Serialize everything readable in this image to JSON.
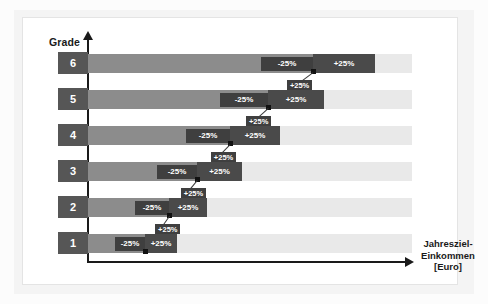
{
  "chart_data": {
    "type": "bar",
    "title": "",
    "xlabel": "Jahresziel-Einkommen [Euro]",
    "ylabel": "Grade",
    "categories": [
      "6",
      "5",
      "4",
      "3",
      "2",
      "1"
    ],
    "series": [
      {
        "name": "Grundgehalt",
        "values": [
          100,
          84,
          69,
          57,
          47,
          39
        ]
      }
    ],
    "band_labels": {
      "lower": "-25%",
      "upper": "+25%"
    },
    "connector_label": "+25%",
    "grid": false,
    "legend": "none",
    "note": "Gehaltsbandbreiten je Grade: Mitte +/- 25%, jede Grade-Obergrenze verbindet zur naechst hoeheren Grade"
  },
  "axes": {
    "y_title": "Grade",
    "x_title_line1": "Jahresziel-",
    "x_title_line2": "Einkommen",
    "x_title_line3": "[Euro]"
  },
  "rows": [
    {
      "grade": "6",
      "minus_label": "-25%",
      "plus_label": "+25%",
      "connector_label": "+25%"
    },
    {
      "grade": "5",
      "minus_label": "-25%",
      "plus_label": "+25%",
      "connector_label": "+25%"
    },
    {
      "grade": "4",
      "minus_label": "-25%",
      "plus_label": "+25%",
      "connector_label": "+25%"
    },
    {
      "grade": "3",
      "minus_label": "-25%",
      "plus_label": "+25%",
      "connector_label": "+25%"
    },
    {
      "grade": "2",
      "minus_label": "-25%",
      "plus_label": "+25%",
      "connector_label": "+25%"
    },
    {
      "grade": "1",
      "minus_label": "-25%",
      "plus_label": "+25%",
      "connector_label": "+25%"
    }
  ],
  "colors": {
    "grade_box": "#565656",
    "value_bar": "#8c8c8c",
    "background_bar": "#e9e9e9",
    "tag_minus": "#3f3f3f",
    "tag_plus": "#4a4a4a",
    "axis": "#1a1a1a",
    "panel": "#ffffff"
  }
}
